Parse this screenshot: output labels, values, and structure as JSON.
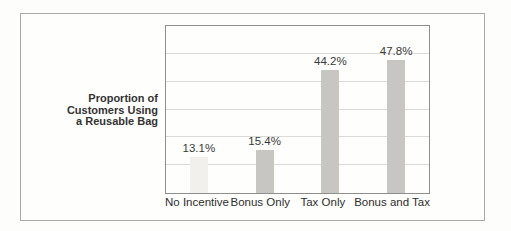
{
  "figure": {
    "frame_border_color": "#aaaaa8",
    "background_color": "#fdfdfc"
  },
  "chart_data": {
    "type": "bar",
    "title": "",
    "ylabel": "Proportion of Customers Using a Reusable Bag",
    "ylabel_lines": [
      "Proportion of",
      "Customers Using",
      "a Reusable Bag"
    ],
    "xlabel": "",
    "categories": [
      "No Incentive",
      "Bonus Only",
      "Tax Only",
      "Bonus and Tax"
    ],
    "values": [
      13.1,
      15.4,
      44.2,
      47.8
    ],
    "value_labels": [
      "13.1%",
      "15.4%",
      "44.2%",
      "47.8%"
    ],
    "ylim": [
      0,
      60
    ],
    "grid_step": 10,
    "grid": true,
    "legend": false,
    "bar_colors": [
      "#f2f0ed",
      "#c7c6c3",
      "#c7c6c3",
      "#c7c6c3"
    ],
    "gridline_color": "#dadad8",
    "plot_border_color": "#8e8e8c",
    "value_label_color": "#3a3a39",
    "axis_label_color": "#2e2e2d"
  }
}
